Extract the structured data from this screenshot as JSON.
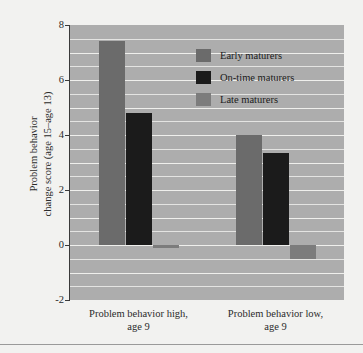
{
  "chart_data": {
    "type": "bar",
    "title": "",
    "xlabel": "",
    "ylabel": "Problem behavior change score (age 15–age 13)",
    "ylabel_line1": "Problem behavior",
    "ylabel_line2": "change score (age 15–age 13)",
    "categories": [
      "Problem behavior high, age 9",
      "Problem behavior low, age 9"
    ],
    "category_labels": [
      {
        "line1": "Problem behavior high,",
        "line2": "age 9"
      },
      {
        "line1": "Problem behavior low,",
        "line2": "age 9"
      }
    ],
    "series": [
      {
        "name": "Early maturers",
        "color": "#6b6b6b",
        "values": [
          7.4,
          4.0
        ]
      },
      {
        "name": "On-time maturers",
        "color": "#1b1b1b",
        "values": [
          4.8,
          3.35
        ]
      },
      {
        "name": "Late maturers",
        "color": "#7c7c7c",
        "values": [
          -0.1,
          -0.5
        ]
      }
    ],
    "ylim": [
      -2,
      8
    ],
    "y_ticks": [
      8,
      6,
      4,
      2,
      0,
      -2
    ],
    "y_tick_labels": [
      "8",
      "6",
      "4",
      "2",
      "0",
      "-2"
    ],
    "y_gridlines": [
      7.5,
      7,
      6.5,
      6,
      5.5,
      5,
      4.5,
      4,
      3.5,
      3,
      2.5,
      2,
      1.5,
      1,
      0.5,
      0,
      -0.5,
      -1,
      -1.5
    ],
    "y_major_gridlines": [
      7,
      6,
      5,
      4,
      3,
      2,
      1,
      0,
      -1
    ],
    "grid": true,
    "legend_position": "upper right",
    "plot_background": "#adadad",
    "figure_background": "#f2f2f0"
  },
  "legend": {
    "items": [
      {
        "label": "Early maturers",
        "color": "#6b6b6b"
      },
      {
        "label": "On-time maturers",
        "color": "#1b1b1b"
      },
      {
        "label": "Late maturers",
        "color": "#7c7c7c"
      }
    ]
  },
  "axis": {
    "y_title_line1": "Problem behavior",
    "y_title_line2": "change score (age 15–age 13)",
    "y_labels": {
      "t8": "8",
      "t6": "6",
      "t4": "4",
      "t2": "2",
      "t0": "0",
      "tm2": "-2"
    }
  },
  "x_axis": {
    "group1_line1": "Problem behavior high,",
    "group1_line2": "age 9",
    "group2_line1": "Problem behavior low,",
    "group2_line2": "age 9"
  }
}
